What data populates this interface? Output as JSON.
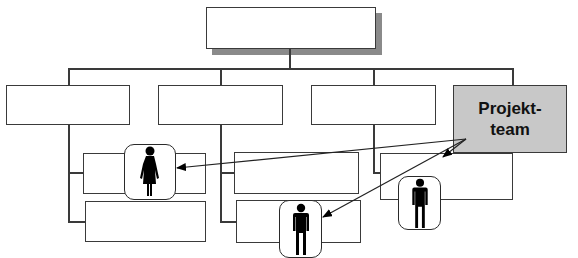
{
  "diagram": {
    "type": "org-chart",
    "top_box": {
      "label": ""
    },
    "level2": [
      {
        "label": ""
      },
      {
        "label": ""
      },
      {
        "label": ""
      }
    ],
    "project_team": {
      "line1": "Projekt-",
      "line2": "team",
      "fill": "#c8c8c8"
    },
    "sub_boxes": [
      {
        "column": 1,
        "label": ""
      },
      {
        "column": 1,
        "label": ""
      },
      {
        "column": 2,
        "label": ""
      },
      {
        "column": 2,
        "label": ""
      },
      {
        "column": 3,
        "label": ""
      }
    ],
    "members": [
      {
        "icon": "woman-icon",
        "column": 1
      },
      {
        "icon": "man-icon",
        "column": 2
      },
      {
        "icon": "man-icon",
        "column": 3
      }
    ],
    "arrows": [
      {
        "from": "project_team",
        "to": "member-1"
      },
      {
        "from": "project_team",
        "to": "member-2"
      },
      {
        "from": "project_team",
        "to": "member-3"
      }
    ]
  }
}
